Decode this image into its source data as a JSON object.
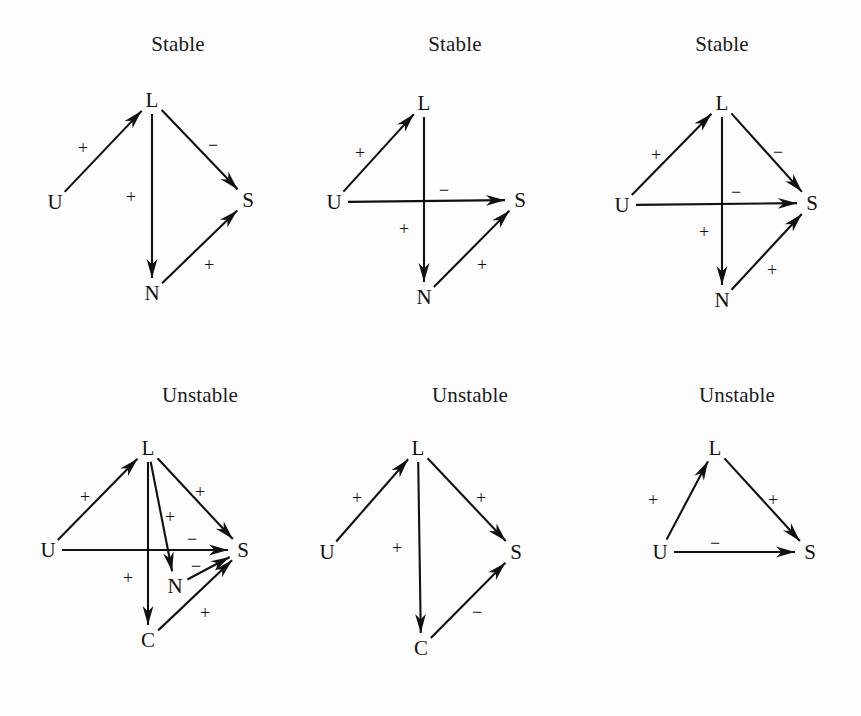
{
  "figure": {
    "background": "#fdfdfd",
    "ink": "#111111",
    "node_names": [
      "U",
      "L",
      "S",
      "N",
      "C"
    ],
    "sign_positive": "+",
    "sign_negative": "−"
  },
  "chart_data": {
    "type": "diagram",
    "title": "",
    "diagram_kind": "signed directed graph (causal loop) panels",
    "panel_layout": {
      "rows": 2,
      "cols": 3
    },
    "panels": [
      {
        "id": "panel-1",
        "title": "Stable",
        "nodes": [
          {
            "id": "L",
            "label": "L",
            "x": 152,
            "y": 100
          },
          {
            "id": "U",
            "label": "U",
            "x": 55,
            "y": 202
          },
          {
            "id": "S",
            "label": "S",
            "x": 248,
            "y": 200
          },
          {
            "id": "N",
            "label": "N",
            "x": 152,
            "y": 293
          }
        ],
        "edges": [
          {
            "from": "U",
            "to": "L",
            "sign": "+",
            "label_x": 83,
            "label_y": 148
          },
          {
            "from": "L",
            "to": "S",
            "sign": "−",
            "label_x": 213,
            "label_y": 145
          },
          {
            "from": "L",
            "to": "N",
            "sign": "+",
            "label_x": 131,
            "label_y": 197
          },
          {
            "from": "N",
            "to": "S",
            "sign": "+",
            "label_x": 209,
            "label_y": 265
          }
        ]
      },
      {
        "id": "panel-2",
        "title": "Stable",
        "nodes": [
          {
            "id": "L",
            "label": "L",
            "x": 424,
            "y": 103
          },
          {
            "id": "U",
            "label": "U",
            "x": 334,
            "y": 202
          },
          {
            "id": "S",
            "label": "S",
            "x": 520,
            "y": 200
          },
          {
            "id": "N",
            "label": "N",
            "x": 424,
            "y": 297
          }
        ],
        "edges": [
          {
            "from": "U",
            "to": "L",
            "sign": "+",
            "label_x": 360,
            "label_y": 153
          },
          {
            "from": "U",
            "to": "S",
            "sign": "−",
            "label_x": 444,
            "label_y": 190
          },
          {
            "from": "L",
            "to": "N",
            "sign": "+",
            "label_x": 404,
            "label_y": 229
          },
          {
            "from": "N",
            "to": "S",
            "sign": "+",
            "label_x": 482,
            "label_y": 265
          }
        ]
      },
      {
        "id": "panel-3",
        "title": "Stable",
        "nodes": [
          {
            "id": "L",
            "label": "L",
            "x": 722,
            "y": 103
          },
          {
            "id": "U",
            "label": "U",
            "x": 622,
            "y": 205
          },
          {
            "id": "S",
            "label": "S",
            "x": 812,
            "y": 203
          },
          {
            "id": "N",
            "label": "N",
            "x": 722,
            "y": 300
          }
        ],
        "edges": [
          {
            "from": "U",
            "to": "L",
            "sign": "+",
            "label_x": 656,
            "label_y": 155
          },
          {
            "from": "L",
            "to": "S",
            "sign": "−",
            "label_x": 778,
            "label_y": 152
          },
          {
            "from": "U",
            "to": "S",
            "sign": "−",
            "label_x": 736,
            "label_y": 192
          },
          {
            "from": "L",
            "to": "N",
            "sign": "+",
            "label_x": 704,
            "label_y": 232
          },
          {
            "from": "N",
            "to": "S",
            "sign": "+",
            "label_x": 772,
            "label_y": 270
          }
        ]
      },
      {
        "id": "panel-4",
        "title": "Unstable",
        "nodes": [
          {
            "id": "L",
            "label": "L",
            "x": 148,
            "y": 448
          },
          {
            "id": "U",
            "label": "U",
            "x": 48,
            "y": 550
          },
          {
            "id": "S",
            "label": "S",
            "x": 243,
            "y": 550
          },
          {
            "id": "N",
            "label": "N",
            "x": 175,
            "y": 586
          },
          {
            "id": "C",
            "label": "C",
            "x": 148,
            "y": 640
          }
        ],
        "edges": [
          {
            "from": "U",
            "to": "L",
            "sign": "+",
            "label_x": 85,
            "label_y": 497
          },
          {
            "from": "L",
            "to": "S",
            "sign": "+",
            "label_x": 200,
            "label_y": 492
          },
          {
            "from": "L",
            "to": "N",
            "sign": "+",
            "label_x": 170,
            "label_y": 517
          },
          {
            "from": "U",
            "to": "S",
            "sign": "−",
            "label_x": 192,
            "label_y": 539
          },
          {
            "from": "N",
            "to": "S",
            "sign": "−",
            "label_x": 196,
            "label_y": 566
          },
          {
            "from": "L",
            "to": "C",
            "sign": "+",
            "label_x": 128,
            "label_y": 578
          },
          {
            "from": "C",
            "to": "S",
            "sign": "+",
            "label_x": 205,
            "label_y": 613
          }
        ]
      },
      {
        "id": "panel-5",
        "title": "Unstable",
        "nodes": [
          {
            "id": "L",
            "label": "L",
            "x": 418,
            "y": 448
          },
          {
            "id": "U",
            "label": "U",
            "x": 327,
            "y": 552
          },
          {
            "id": "S",
            "label": "S",
            "x": 516,
            "y": 552
          },
          {
            "id": "C",
            "label": "C",
            "x": 421,
            "y": 648
          }
        ],
        "edges": [
          {
            "from": "U",
            "to": "L",
            "sign": "+",
            "label_x": 357,
            "label_y": 498
          },
          {
            "from": "L",
            "to": "S",
            "sign": "+",
            "label_x": 481,
            "label_y": 498
          },
          {
            "from": "L",
            "to": "C",
            "sign": "+",
            "label_x": 397,
            "label_y": 548
          },
          {
            "from": "C",
            "to": "S",
            "sign": "−",
            "label_x": 477,
            "label_y": 612
          }
        ]
      },
      {
        "id": "panel-6",
        "title": "Unstable",
        "nodes": [
          {
            "id": "L",
            "label": "L",
            "x": 715,
            "y": 448
          },
          {
            "id": "U",
            "label": "U",
            "x": 660,
            "y": 552
          },
          {
            "id": "S",
            "label": "S",
            "x": 810,
            "y": 552
          }
        ],
        "edges": [
          {
            "from": "U",
            "to": "L",
            "sign": "+",
            "label_x": 653,
            "label_y": 500
          },
          {
            "from": "L",
            "to": "S",
            "sign": "+",
            "label_x": 773,
            "label_y": 500
          },
          {
            "from": "U",
            "to": "S",
            "sign": "−",
            "label_x": 715,
            "label_y": 543
          }
        ]
      }
    ],
    "titles": [
      {
        "text": "Stable",
        "x": 178,
        "y": 32
      },
      {
        "text": "Stable",
        "x": 455,
        "y": 32
      },
      {
        "text": "Stable",
        "x": 722,
        "y": 32
      },
      {
        "text": "Unstable",
        "x": 200,
        "y": 383
      },
      {
        "text": "Unstable",
        "x": 470,
        "y": 383
      },
      {
        "text": "Unstable",
        "x": 737,
        "y": 383
      }
    ]
  }
}
